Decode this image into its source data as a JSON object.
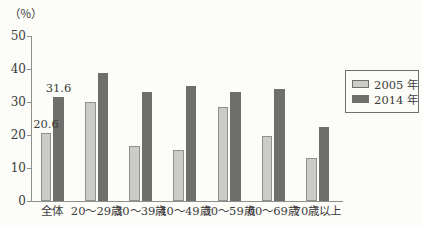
{
  "chart_data": {
    "type": "bar",
    "title": "",
    "unit_label": "（％）",
    "categories": [
      "全体",
      "20〜29歳",
      "30〜39歳",
      "40〜49歳",
      "50〜59歳",
      "60〜69歳",
      "70歳以上"
    ],
    "series": [
      {
        "name": "2005 年",
        "color": "#cbcbc9",
        "values": [
          20.6,
          30.0,
          16.6,
          15.5,
          28.4,
          19.8,
          13.1
        ]
      },
      {
        "name": "2014 年",
        "color": "#6e6e6c",
        "values": [
          31.6,
          38.8,
          33.0,
          34.9,
          33.1,
          33.9,
          22.3
        ]
      }
    ],
    "ylim": [
      0,
      50
    ],
    "yticks": [
      0,
      10,
      20,
      30,
      40,
      50
    ],
    "grid": false,
    "legend_position": "right",
    "data_labels": [
      {
        "category": "全体",
        "series_index": 0,
        "text": "20.6"
      },
      {
        "category": "全体",
        "series_index": 1,
        "text": "31.6"
      }
    ]
  }
}
